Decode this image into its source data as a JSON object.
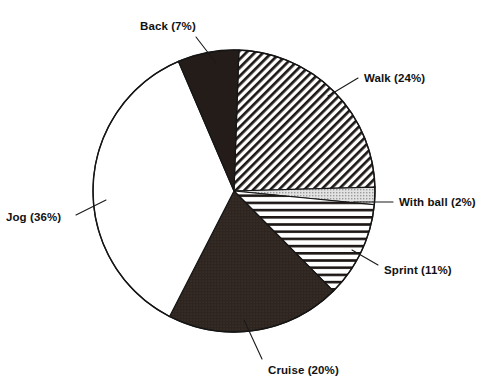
{
  "chart_data": {
    "type": "pie",
    "title": "",
    "subtitle": "",
    "xlabel": "",
    "ylabel": "",
    "legend_position": "none",
    "grid": false,
    "labels_include_percent": true,
    "categories": [
      "Walk",
      "With ball",
      "Sprint",
      "Cruise",
      "Jog",
      "Back"
    ],
    "values": [
      24,
      2,
      11,
      20,
      36,
      7
    ],
    "units": "percent",
    "total": 100,
    "slices": [
      {
        "name": "Walk",
        "label": "Walk (24%)",
        "value": 24,
        "percent": "24%",
        "fill_pattern": "diagonal-hatch",
        "start_angle_deg": 2,
        "end_angle_deg": 88.4
      },
      {
        "name": "With ball",
        "label": "With ball (2%)",
        "value": 2,
        "percent": "2%",
        "fill_pattern": "light-gray-stipple",
        "start_angle_deg": 88.4,
        "end_angle_deg": 95.6
      },
      {
        "name": "Sprint",
        "label": "Sprint (11%)",
        "value": 11,
        "percent": "11%",
        "fill_pattern": "horizontal-stripe",
        "start_angle_deg": 95.6,
        "end_angle_deg": 135.2
      },
      {
        "name": "Cruise",
        "label": "Cruise (20%)",
        "value": 20,
        "percent": "20%",
        "fill_pattern": "solid-dark",
        "start_angle_deg": 135.2,
        "end_angle_deg": 207.2
      },
      {
        "name": "Jog",
        "label": "Jog (36%)",
        "value": 36,
        "percent": "36%",
        "fill_pattern": "white",
        "start_angle_deg": 207.2,
        "end_angle_deg": 336.8
      },
      {
        "name": "Back",
        "label": "Back (7%)",
        "value": 7,
        "percent": "7%",
        "fill_pattern": "solid-black",
        "start_angle_deg": 336.8,
        "end_angle_deg": 362
      }
    ],
    "colors": {
      "outline": "#151515",
      "solid_black": "#231c18",
      "solid_dark": "#2e2520",
      "light_gray": "#cfcfcf",
      "white": "#ffffff",
      "text": "#111111"
    },
    "geometry": {
      "center_x": 234,
      "center_y": 191,
      "radius": 141
    }
  }
}
